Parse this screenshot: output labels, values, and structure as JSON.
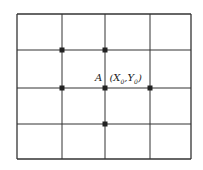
{
  "diagram": {
    "type": "grid-stencil",
    "grid": {
      "columns": 4,
      "rows": 4,
      "line_color": "#333333",
      "x_lines": [
        17,
        62,
        105,
        150,
        191
      ],
      "y_lines": [
        14,
        50,
        88,
        124,
        159
      ]
    },
    "points": [
      {
        "name": "top-left",
        "x": 62,
        "y": 50
      },
      {
        "name": "top",
        "x": 105,
        "y": 50
      },
      {
        "name": "left",
        "x": 62,
        "y": 88
      },
      {
        "name": "center-A",
        "x": 105,
        "y": 88
      },
      {
        "name": "right",
        "x": 150,
        "y": 88
      },
      {
        "name": "bottom",
        "x": 105,
        "y": 124
      }
    ],
    "point_color": "#222222",
    "label": {
      "point": "A",
      "coords_open": "(",
      "x": "X",
      "x_sub": "0",
      "sep": ",",
      "y": "Y",
      "y_sub": "0",
      "coords_close": ")"
    }
  }
}
